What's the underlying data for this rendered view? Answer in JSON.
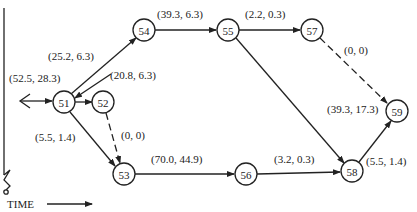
{
  "diagram": {
    "type": "activity-network",
    "time_label": "TIME",
    "nodes": [
      {
        "id": "51",
        "label": "51"
      },
      {
        "id": "52",
        "label": "52"
      },
      {
        "id": "53",
        "label": "53"
      },
      {
        "id": "54",
        "label": "54"
      },
      {
        "id": "55",
        "label": "55"
      },
      {
        "id": "56",
        "label": "56"
      },
      {
        "id": "57",
        "label": "57"
      },
      {
        "id": "58",
        "label": "58"
      },
      {
        "id": "59",
        "label": "59"
      }
    ],
    "edges": [
      {
        "from": "start",
        "to": "51",
        "label": "(52.5, 28.3)",
        "style": "solid"
      },
      {
        "from": "51",
        "to": "54",
        "label": "(25.2, 6.3)",
        "style": "solid"
      },
      {
        "from": "54",
        "to": "51",
        "label": "(20.8, 6.3)",
        "style": "solid"
      },
      {
        "from": "51",
        "to": "52",
        "label": "",
        "style": "solid"
      },
      {
        "from": "51",
        "to": "53",
        "label": "(5.5, 1.4)",
        "style": "solid"
      },
      {
        "from": "52",
        "to": "53",
        "label": "(0, 0)",
        "style": "dashed"
      },
      {
        "from": "54",
        "to": "55",
        "label": "(39.3, 6.3)",
        "style": "solid"
      },
      {
        "from": "55",
        "to": "57",
        "label": "(2.2, 0.3)",
        "style": "solid"
      },
      {
        "from": "57",
        "to": "59",
        "label": "(0, 0)",
        "style": "dashed"
      },
      {
        "from": "55",
        "to": "58",
        "label": "(39.3, 17.3)",
        "style": "solid"
      },
      {
        "from": "53",
        "to": "56",
        "label": "(70.0, 44.9)",
        "style": "solid"
      },
      {
        "from": "56",
        "to": "58",
        "label": "(3.2, 0.3)",
        "style": "solid"
      },
      {
        "from": "58",
        "to": "59",
        "label": "(5.5, 1.4)",
        "style": "solid"
      }
    ]
  }
}
